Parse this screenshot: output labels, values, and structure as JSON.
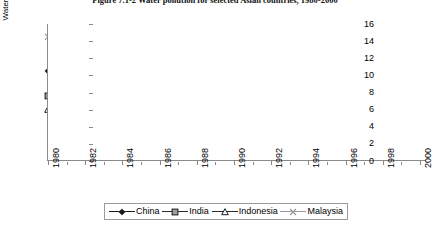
{
  "figure": {
    "title": "Figure 7.1-2  Water pollution for selected Asian countries, 1980-2000"
  },
  "chart_data": {
    "type": "line",
    "title": "Figure 7.1-2  Water pollution for selected Asian countries, 1980-2000",
    "xlabel": "",
    "ylabel": "Water pollution (% BOD emissions)",
    "ylim": [
      0,
      16
    ],
    "ytick_step": 2,
    "yticks": [
      0,
      2,
      4,
      6,
      8,
      10,
      12,
      14,
      16
    ],
    "ytick_labels": [
      "0",
      "2",
      "4",
      "6",
      "8",
      "10",
      "12",
      "14",
      "16"
    ],
    "xlim": [
      1980,
      2000
    ],
    "x": [
      1980,
      1981,
      1982,
      1983,
      1984,
      1985,
      1986,
      1987,
      1988,
      1989,
      1990,
      1991,
      1992,
      1993,
      1994,
      1995,
      1996,
      1997,
      1998,
      1999,
      2000
    ],
    "xtick_labels": [
      "1980",
      "1982",
      "1984",
      "1986",
      "1988",
      "1990",
      "1992",
      "1994",
      "1996",
      "1998",
      "2000"
    ],
    "xtick_values": [
      1980,
      1982,
      1984,
      1986,
      1988,
      1990,
      1992,
      1994,
      1996,
      1998,
      2000
    ],
    "minor_ticks_every": 1,
    "grid": false,
    "legend_position": "bottom",
    "series": [
      {
        "name": "China",
        "marker": "filled-diamond",
        "color": "#1a1a1a",
        "values": [
          10.5,
          9.6,
          9.7,
          9.6,
          9.6,
          9.5,
          9.6,
          9.5,
          9.5,
          9.4,
          12.1,
          12.2,
          12.0,
          11.9,
          11.8,
          11.9,
          11.9,
          12.1,
          10.8,
          10.6,
          10.5
        ]
      },
      {
        "name": "India",
        "marker": "filled-square",
        "color": "#2b2b2b",
        "values": [
          7.6,
          7.3,
          8.2,
          8.3,
          8.3,
          8.1,
          8.2,
          8.0,
          8.1,
          8.1,
          8.2,
          8.2,
          8.1,
          8.0,
          8.0,
          8.1,
          8.0,
          7.9,
          6.4,
          6.5,
          6.6
        ]
      },
      {
        "name": "Indonesia",
        "marker": "open-triangle",
        "color": "#2b2b2b",
        "values": [
          6.0,
          6.2,
          6.2,
          5.6,
          6.3,
          6.2,
          6.1,
          6.2,
          6.4,
          6.5,
          7.1,
          6.9,
          7.0,
          7.1,
          7.2,
          7.5,
          7.8,
          14.8,
          6.3,
          5.3,
          5.5
        ]
      },
      {
        "name": "Malaysia",
        "marker": "cross",
        "color": "#9a9a9a",
        "values": [
          14.5,
          14.4,
          14.6,
          14.3,
          14.2,
          14.5,
          14.2,
          13.8,
          14.1,
          14.2,
          14.6,
          14.5,
          14.3,
          14.3,
          14.2,
          14.2,
          14.1,
          14.8,
          13.4,
          13.2,
          13.0
        ]
      }
    ]
  },
  "legend": {
    "entries": [
      {
        "label": "China"
      },
      {
        "label": "India"
      },
      {
        "label": "Indonesia"
      },
      {
        "label": "Malaysia"
      }
    ]
  }
}
